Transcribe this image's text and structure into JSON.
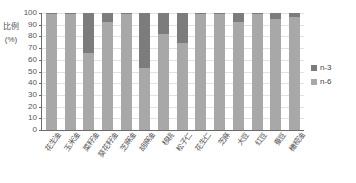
{
  "chart_data": {
    "type": "bar",
    "stacked": true,
    "title": "",
    "xlabel": "",
    "ylabel": "比例（%）",
    "ylabel_text": "比例",
    "ylabel_unit": "(%)",
    "ylim": [
      0,
      100
    ],
    "ytick_step": 10,
    "yticks": [
      100,
      90,
      80,
      70,
      60,
      50,
      40,
      30,
      20,
      10,
      0
    ],
    "grid": true,
    "legend_position": "right",
    "categories": [
      "花生油",
      "玉米油",
      "菜籽油",
      "葵花籽油",
      "芝麻油",
      "胡麻油",
      "核桃",
      "松子仁",
      "花生仁",
      "芝麻",
      "大豆",
      "红豆",
      "蚕豆",
      "橄榄油"
    ],
    "series": [
      {
        "name": "n-6",
        "color": "#a8a8a8",
        "values": [
          99,
          99,
          66,
          92,
          99,
          53,
          82,
          74,
          99,
          99,
          92,
          99,
          95,
          97
        ]
      },
      {
        "name": "n-3",
        "color": "#7c7c7c",
        "values": [
          1,
          1,
          34,
          8,
          1,
          47,
          18,
          26,
          1,
          1,
          8,
          1,
          5,
          3
        ]
      }
    ]
  },
  "legend": {
    "items": [
      {
        "label": "n-3",
        "color": "#7c7c7c"
      },
      {
        "label": "n-6",
        "color": "#a8a8a8"
      }
    ]
  },
  "axis": {
    "y_title_main": "比例",
    "y_title_unit": "(%)"
  }
}
